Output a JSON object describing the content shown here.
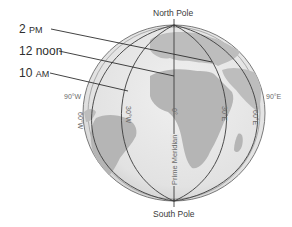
{
  "diagram": {
    "time_labels": [
      {
        "hour": "2",
        "suffix": "PM"
      },
      {
        "hour": "12 noon",
        "suffix": ""
      },
      {
        "hour": "10",
        "suffix": "AM"
      }
    ],
    "poles": {
      "north": "North Pole",
      "south": "South Pole"
    },
    "meridian_labels": {
      "w90": "90°W",
      "e90": "90°E",
      "w60": "60°W",
      "w30": "30°W",
      "zero": "0°",
      "e30": "30°E",
      "e60": "60°E",
      "prime": "Prime Meridian"
    },
    "colors": {
      "ocean": "#e6e6e6",
      "land": "#b9b9b9",
      "rim": "#cfcfcf",
      "lines": "#3c3c3c"
    }
  }
}
